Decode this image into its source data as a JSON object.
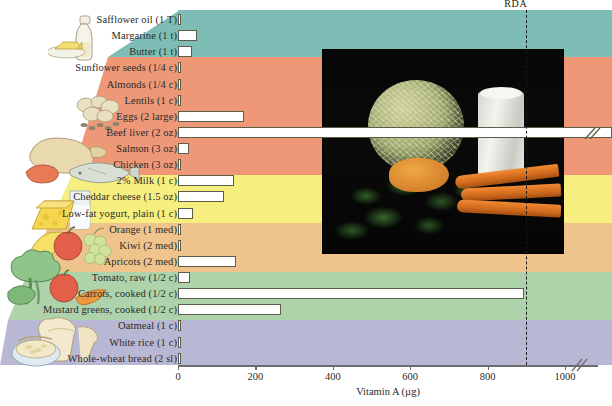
{
  "chart_data": {
    "type": "bar",
    "title": "",
    "xlabel": "Vitamin A (µg)",
    "ylabel": "",
    "xlim": [
      0,
      1050
    ],
    "xticks": [
      0,
      200,
      400,
      600,
      800,
      1000
    ],
    "xticklabels": [
      "0",
      "200",
      "400",
      "600",
      "800",
      "1000"
    ],
    "grid": false,
    "orientation": "horizontal",
    "axis_break": true,
    "annotations": [
      {
        "name": "rda",
        "label": "RDA",
        "value": 900
      }
    ],
    "categories": [
      "Safflower oil (1 T)",
      "Margarine (1 t)",
      "Butter (1 t)",
      "Sunflower seeds (1/4 c)",
      "Almonds (1/4 c)",
      "Lentils (1 c)",
      "Eggs (2 large)",
      "Beef liver (2 oz)",
      "Salmon (3 oz)",
      "Chicken (3 oz)",
      "2% Milk (1 c)",
      "Cheddar cheese (1.5 oz)",
      "Low-fat yogurt, plain (1 c)",
      "Orange (1 med)",
      "Kiwi (2 med)",
      "Apricots (2 med)",
      "Tomato, raw (1/2 c)",
      "Carrots, cooked (1/2 c)",
      "Mustard greens, cooked (1/2 c)",
      "Oatmeal (1 c)",
      "White rice (1 c)",
      "Whole-wheat bread (2 sl)"
    ],
    "values": [
      0,
      50,
      35,
      0,
      0,
      8,
      170,
      1100,
      28,
      5,
      145,
      120,
      38,
      7,
      5,
      150,
      32,
      895,
      265,
      0,
      0,
      0
    ],
    "offscale_index": 7,
    "groups": [
      {
        "name": "Fats & oils",
        "color": "#7dbdb5",
        "rows": [
          0,
          2
        ]
      },
      {
        "name": "Protein foods",
        "color": "#ee9877",
        "rows": [
          3,
          9
        ]
      },
      {
        "name": "Dairy",
        "color": "#f6ef7f",
        "rows": [
          10,
          12
        ]
      },
      {
        "name": "Fruits",
        "color": "#eec38c",
        "rows": [
          13,
          15
        ]
      },
      {
        "name": "Vegetables",
        "color": "#aed3ab",
        "rows": [
          16,
          18
        ]
      },
      {
        "name": "Grains",
        "color": "#b9b8d4",
        "rows": [
          19,
          21
        ]
      }
    ]
  },
  "photo": {
    "name": "vitamin-a-foods-photo",
    "caption": "",
    "subjects": [
      "cantaloupe",
      "glass of milk",
      "leafy greens",
      "winter squash",
      "carrots"
    ]
  },
  "illustrations": [
    {
      "name": "oil-bottle-and-butter-illustration"
    },
    {
      "name": "nuts-and-seeds-illustration"
    },
    {
      "name": "poultry-meat-and-fish-illustration"
    },
    {
      "name": "cheese-and-milk-illustration"
    },
    {
      "name": "fruit-basket-illustration"
    },
    {
      "name": "broccoli-tomato-carrot-illustration"
    },
    {
      "name": "bread-and-oatmeal-illustration"
    }
  ],
  "colors": {
    "fats": "#7dbdb5",
    "protein": "#ee9877",
    "dairy": "#f6ef7f",
    "fruit": "#eec38c",
    "vegetables": "#aed3ab",
    "grains": "#b9b8d4",
    "bar_fill": "#ffffff",
    "bar_stroke": "#5d5d49",
    "rda_line": "#1b1b1b"
  }
}
